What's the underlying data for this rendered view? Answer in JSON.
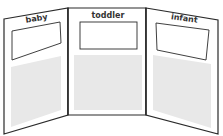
{
  "diagram": {
    "type": "trifold-display-board",
    "colors": {
      "outline": "#2a2a2a",
      "background": "#ffffff",
      "content_area": "#e8e8e8",
      "label_box_fill": "#ffffff"
    },
    "panels": [
      {
        "id": "left",
        "label": "baby"
      },
      {
        "id": "center",
        "label": "toddler"
      },
      {
        "id": "right",
        "label": "infant"
      }
    ]
  }
}
